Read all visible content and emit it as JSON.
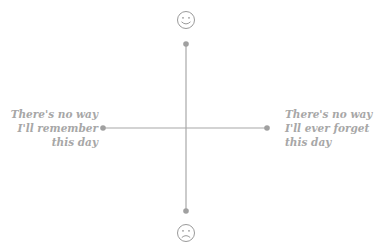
{
  "diagram": {
    "type": "quadrant-axes",
    "colors": {
      "axis": "#a8a8a8",
      "text": "#a7a7a7",
      "face": "#9a9a9a",
      "background": "#ffffff"
    },
    "axes": {
      "vertical": {
        "top_icon": "smiley-face-icon",
        "bottom_icon": "sad-face-icon"
      },
      "horizontal": {
        "left_label": "There's no way\nI'll remember\nthis day",
        "right_label": "There's no way\nI'll ever forget\nthis day"
      }
    }
  }
}
